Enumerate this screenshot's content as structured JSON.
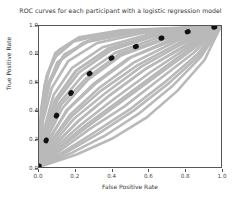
{
  "chart_data": {
    "type": "line",
    "title": "ROC curves for each participant with a logistic regression model",
    "xlabel": "False Positive Rate",
    "ylabel": "True Positive Rate",
    "xlim": [
      0.0,
      1.0
    ],
    "ylim": [
      0.0,
      1.0
    ],
    "xticks": [
      "0.0",
      "0.2",
      "0.4",
      "0.6",
      "0.8",
      "1.0"
    ],
    "yticks": [
      "0.0",
      "0.2",
      "0.4",
      "0.6",
      "0.8",
      "1.0"
    ],
    "xtick_values": [
      0.0,
      0.2,
      0.4,
      0.6,
      0.8,
      1.0
    ],
    "ytick_values": [
      0.0,
      0.2,
      0.4,
      0.6,
      0.8,
      1.0
    ],
    "grid": false,
    "legend": "none",
    "participant_curve_color": "#b9b9b9",
    "mean_curve_color": "#111111",
    "mean_curve_style": "dotted",
    "series": [
      {
        "name": "participant-01",
        "x": [
          0.0,
          0.02,
          0.06,
          0.14,
          0.3,
          0.55,
          1.0
        ],
        "y": [
          0.0,
          0.38,
          0.62,
          0.8,
          0.91,
          0.97,
          1.0
        ]
      },
      {
        "name": "participant-02",
        "x": [
          0.0,
          0.01,
          0.04,
          0.1,
          0.24,
          0.5,
          1.0
        ],
        "y": [
          0.0,
          0.3,
          0.55,
          0.74,
          0.88,
          0.95,
          1.0
        ]
      },
      {
        "name": "participant-03",
        "x": [
          0.0,
          0.03,
          0.09,
          0.2,
          0.38,
          0.62,
          1.0
        ],
        "y": [
          0.0,
          0.26,
          0.48,
          0.68,
          0.84,
          0.93,
          1.0
        ]
      },
      {
        "name": "participant-04",
        "x": [
          0.0,
          0.05,
          0.13,
          0.27,
          0.45,
          0.7,
          1.0
        ],
        "y": [
          0.0,
          0.22,
          0.42,
          0.62,
          0.79,
          0.91,
          1.0
        ]
      },
      {
        "name": "participant-05",
        "x": [
          0.0,
          0.07,
          0.17,
          0.33,
          0.52,
          0.75,
          1.0
        ],
        "y": [
          0.0,
          0.19,
          0.37,
          0.56,
          0.74,
          0.89,
          1.0
        ]
      },
      {
        "name": "participant-06",
        "x": [
          0.0,
          0.02,
          0.05,
          0.11,
          0.22,
          0.45,
          1.0
        ],
        "y": [
          0.0,
          0.44,
          0.67,
          0.83,
          0.92,
          0.97,
          1.0
        ]
      },
      {
        "name": "participant-07",
        "x": [
          0.0,
          0.09,
          0.21,
          0.38,
          0.58,
          0.8,
          1.0
        ],
        "y": [
          0.0,
          0.16,
          0.32,
          0.5,
          0.69,
          0.86,
          1.0
        ]
      },
      {
        "name": "participant-08",
        "x": [
          0.0,
          0.04,
          0.11,
          0.24,
          0.42,
          0.66,
          1.0
        ],
        "y": [
          0.0,
          0.24,
          0.45,
          0.65,
          0.81,
          0.92,
          1.0
        ]
      },
      {
        "name": "participant-09",
        "x": [
          0.0,
          0.12,
          0.26,
          0.44,
          0.64,
          0.84,
          1.0
        ],
        "y": [
          0.0,
          0.14,
          0.28,
          0.45,
          0.64,
          0.83,
          1.0
        ]
      },
      {
        "name": "participant-10",
        "x": [
          0.0,
          0.01,
          0.03,
          0.08,
          0.19,
          0.42,
          1.0
        ],
        "y": [
          0.0,
          0.34,
          0.58,
          0.77,
          0.89,
          0.96,
          1.0
        ]
      },
      {
        "name": "participant-11",
        "x": [
          0.0,
          0.06,
          0.15,
          0.3,
          0.49,
          0.72,
          1.0
        ],
        "y": [
          0.0,
          0.2,
          0.4,
          0.59,
          0.77,
          0.9,
          1.0
        ]
      },
      {
        "name": "participant-12",
        "x": [
          0.0,
          0.15,
          0.31,
          0.5,
          0.69,
          0.87,
          1.0
        ],
        "y": [
          0.0,
          0.12,
          0.25,
          0.41,
          0.6,
          0.8,
          1.0
        ]
      },
      {
        "name": "participant-13",
        "x": [
          0.0,
          0.03,
          0.08,
          0.18,
          0.35,
          0.6,
          1.0
        ],
        "y": [
          0.0,
          0.28,
          0.51,
          0.7,
          0.85,
          0.94,
          1.0
        ]
      },
      {
        "name": "participant-14",
        "x": [
          0.0,
          0.1,
          0.23,
          0.41,
          0.61,
          0.82,
          1.0
        ],
        "y": [
          0.0,
          0.15,
          0.3,
          0.48,
          0.67,
          0.85,
          1.0
        ]
      },
      {
        "name": "participant-15",
        "x": [
          0.0,
          0.02,
          0.07,
          0.16,
          0.32,
          0.57,
          1.0
        ],
        "y": [
          0.0,
          0.32,
          0.56,
          0.75,
          0.88,
          0.95,
          1.0
        ]
      },
      {
        "name": "participant-16",
        "x": [
          0.0,
          0.18,
          0.36,
          0.55,
          0.73,
          0.89,
          1.0
        ],
        "y": [
          0.0,
          0.1,
          0.22,
          0.38,
          0.57,
          0.78,
          1.0
        ]
      },
      {
        "name": "participant-17",
        "x": [
          0.0,
          0.05,
          0.12,
          0.26,
          0.44,
          0.68,
          1.0
        ],
        "y": [
          0.0,
          0.23,
          0.44,
          0.63,
          0.8,
          0.91,
          1.0
        ]
      },
      {
        "name": "participant-18",
        "x": [
          0.0,
          0.08,
          0.19,
          0.36,
          0.56,
          0.78,
          1.0
        ],
        "y": [
          0.0,
          0.17,
          0.34,
          0.52,
          0.71,
          0.87,
          1.0
        ]
      },
      {
        "name": "participant-19",
        "x": [
          0.0,
          0.01,
          0.04,
          0.09,
          0.21,
          0.47,
          1.0
        ],
        "y": [
          0.0,
          0.4,
          0.64,
          0.81,
          0.91,
          0.96,
          1.0
        ]
      },
      {
        "name": "participant-20",
        "x": [
          0.0,
          0.13,
          0.28,
          0.47,
          0.66,
          0.85,
          1.0
        ],
        "y": [
          0.0,
          0.13,
          0.27,
          0.43,
          0.62,
          0.81,
          1.0
        ]
      },
      {
        "name": "participant-21",
        "x": [
          0.0,
          0.04,
          0.1,
          0.22,
          0.4,
          0.64,
          1.0
        ],
        "y": [
          0.0,
          0.25,
          0.47,
          0.67,
          0.83,
          0.93,
          1.0
        ]
      },
      {
        "name": "participant-22",
        "x": [
          0.0,
          0.21,
          0.4,
          0.59,
          0.76,
          0.91,
          1.0
        ],
        "y": [
          0.0,
          0.09,
          0.2,
          0.35,
          0.54,
          0.76,
          1.0
        ]
      },
      {
        "name": "participant-23",
        "x": [
          0.0,
          0.06,
          0.16,
          0.32,
          0.51,
          0.74,
          1.0
        ],
        "y": [
          0.0,
          0.21,
          0.41,
          0.6,
          0.78,
          0.9,
          1.0
        ]
      },
      {
        "name": "participant-24",
        "x": [
          0.0,
          0.02,
          0.06,
          0.13,
          0.28,
          0.53,
          1.0
        ],
        "y": [
          0.0,
          0.36,
          0.6,
          0.78,
          0.9,
          0.96,
          1.0
        ]
      },
      {
        "name": "participant-25",
        "x": [
          0.0,
          0.11,
          0.25,
          0.43,
          0.63,
          0.83,
          1.0
        ],
        "y": [
          0.0,
          0.14,
          0.29,
          0.46,
          0.65,
          0.84,
          1.0
        ]
      },
      {
        "name": "participant-26",
        "x": [
          0.0,
          0.07,
          0.18,
          0.34,
          0.54,
          0.77,
          1.0
        ],
        "y": [
          0.0,
          0.18,
          0.36,
          0.54,
          0.72,
          0.88,
          1.0
        ]
      },
      {
        "name": "participant-27",
        "x": [
          0.0,
          0.03,
          0.1,
          0.21,
          0.39,
          0.63,
          1.0
        ],
        "y": [
          0.0,
          0.27,
          0.49,
          0.69,
          0.84,
          0.93,
          1.0
        ]
      },
      {
        "name": "participant-28",
        "x": [
          0.0,
          0.16,
          0.33,
          0.52,
          0.71,
          0.88,
          1.0
        ],
        "y": [
          0.0,
          0.11,
          0.24,
          0.4,
          0.59,
          0.79,
          1.0
        ]
      },
      {
        "name": "participant-29",
        "x": [
          0.0,
          0.01,
          0.05,
          0.12,
          0.26,
          0.52,
          1.0
        ],
        "y": [
          0.0,
          0.33,
          0.57,
          0.76,
          0.89,
          0.95,
          1.0
        ]
      },
      {
        "name": "participant-30",
        "x": [
          0.0,
          0.09,
          0.22,
          0.39,
          0.59,
          0.81,
          1.0
        ],
        "y": [
          0.0,
          0.16,
          0.33,
          0.51,
          0.7,
          0.86,
          1.0
        ]
      }
    ],
    "mean_series": {
      "name": "mean-roc",
      "x": [
        0.0,
        0.05,
        0.12,
        0.22,
        0.35,
        0.5,
        0.66,
        0.82,
        1.0
      ],
      "y": [
        0.0,
        0.24,
        0.43,
        0.6,
        0.74,
        0.84,
        0.91,
        0.96,
        1.0
      ]
    }
  }
}
